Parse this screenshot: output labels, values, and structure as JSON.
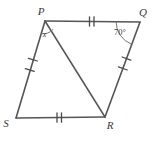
{
  "figure": {
    "name": "quadrilateral-pqrs-with-diagonal",
    "background_color": "#ffffff",
    "stroke_color": "#555555",
    "tick_color": "#4a4a4a",
    "arc_color": "#777777",
    "label_color": "#3a3a3a"
  },
  "vertices": [
    {
      "id": "P",
      "label": "P",
      "x": 45,
      "y": 21,
      "label_x": 41,
      "label_y": 15
    },
    {
      "id": "Q",
      "label": "Q",
      "x": 140,
      "y": 22,
      "label_x": 142,
      "label_y": 16
    },
    {
      "id": "R",
      "label": "R",
      "x": 105,
      "y": 117,
      "label_x": 108,
      "label_y": 128
    },
    {
      "id": "S",
      "label": "S",
      "x": 16,
      "y": 118,
      "label_x": 6,
      "label_y": 126
    }
  ],
  "segments": [
    {
      "id": "PQ",
      "from": "P",
      "to": "Q",
      "ticks": 2,
      "tick_style": "double"
    },
    {
      "id": "QR",
      "from": "Q",
      "to": "R",
      "ticks": 2,
      "tick_style": "spaced-single"
    },
    {
      "id": "SR",
      "from": "S",
      "to": "R",
      "ticks": 2,
      "tick_style": "double"
    },
    {
      "id": "PS",
      "from": "P",
      "to": "S",
      "ticks": 2,
      "tick_style": "spaced-single"
    },
    {
      "id": "PR",
      "from": "P",
      "to": "R",
      "ticks": 0,
      "tick_style": "none",
      "is_diagonal": true
    }
  ],
  "angles": [
    {
      "id": "angle-at-P",
      "vertex": "P",
      "label": "x",
      "label_x": 49,
      "label_y": 35,
      "arc_radius": 13,
      "between": [
        "PS",
        "PR"
      ]
    },
    {
      "id": "angle-at-Q",
      "vertex": "Q",
      "label": "70°",
      "label_x": 115,
      "label_y": 35,
      "arc_radius": 24,
      "between": [
        "QP",
        "QR"
      ]
    }
  ]
}
